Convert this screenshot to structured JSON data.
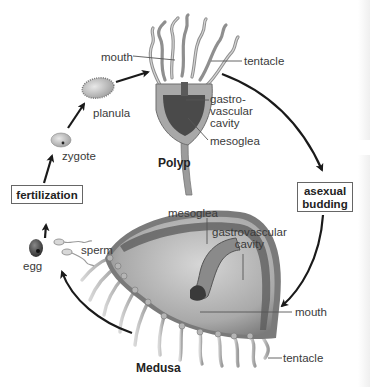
{
  "diagram": {
    "type": "life-cycle",
    "stages": {
      "polyp": {
        "title": "Polyp",
        "labels": {
          "mouth": "mouth",
          "tentacle": "tentacle",
          "gastrovascular_cavity": "gastro-\nvascular\ncavity",
          "mesoglea": "mesoglea"
        }
      },
      "medusa": {
        "title": "Medusa",
        "labels": {
          "mesoglea": "mesoglea",
          "gastrovascular_cavity": "gastrovascular\ncavity",
          "mouth": "mouth",
          "tentacle": "tentacle"
        }
      },
      "egg": "egg",
      "sperm": "sperm",
      "zygote": "zygote",
      "planula": "planula"
    },
    "process_boxes": {
      "fertilization": "fertilization",
      "asexual_budding": "asexual\nbudding"
    },
    "colors": {
      "arrow": "#1a1a1a",
      "tissue": "#9a9a9a",
      "cavity": "#4a4a4a",
      "box_border": "#666666",
      "text": "#3a3a3a"
    }
  }
}
